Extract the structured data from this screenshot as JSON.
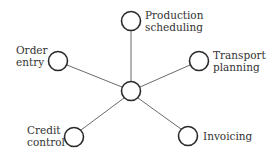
{
  "diagram": {
    "type": "hub-and-spoke",
    "colors": {
      "stroke": "#2a2a2a",
      "line": "#6a6a6a",
      "text": "#333333",
      "background": "#ffffff"
    },
    "hub": {
      "x": 131,
      "y": 91,
      "r": 10
    },
    "nodes": [
      {
        "id": "production",
        "x": 131,
        "y": 21,
        "r": 10,
        "label_lines": [
          "Production",
          "scheduling"
        ]
      },
      {
        "id": "order",
        "x": 58,
        "y": 61,
        "r": 10,
        "label_lines": [
          "Order",
          "entry"
        ]
      },
      {
        "id": "transport",
        "x": 199,
        "y": 61,
        "r": 10,
        "label_lines": [
          "Transport",
          "planning"
        ]
      },
      {
        "id": "credit",
        "x": 74,
        "y": 137,
        "r": 10,
        "label_lines": [
          "Credit",
          "control"
        ]
      },
      {
        "id": "invoicing",
        "x": 188,
        "y": 136,
        "r": 10,
        "label_lines": [
          "Invoicing"
        ]
      }
    ]
  }
}
